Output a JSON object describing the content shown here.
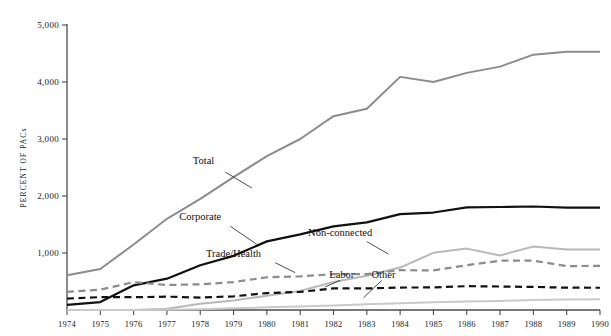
{
  "chart_data": {
    "type": "line",
    "title": "",
    "xlabel": "",
    "ylabel": "PERCENT OF PACs",
    "x": [
      1974,
      1975,
      1976,
      1977,
      1978,
      1979,
      1980,
      1981,
      1982,
      1983,
      1984,
      1985,
      1986,
      1987,
      1988,
      1989,
      1990
    ],
    "xtick_labels": [
      "1974",
      "1975",
      "1976",
      "1977",
      "1978",
      "1979",
      "1980",
      "1981",
      "1982",
      "1983",
      "1984",
      "1985",
      "1986",
      "1987",
      "1988",
      "1989",
      "1990"
    ],
    "ytick_labels": [
      "1,000",
      "2,000",
      "3,000",
      "4,000",
      "5,000"
    ],
    "yticks": [
      1000,
      2000,
      3000,
      4000,
      5000
    ],
    "ylim": [
      0,
      5000
    ],
    "xlim": [
      1974,
      1990
    ],
    "grid": false,
    "legend": "inline-annotations",
    "series": [
      {
        "name": "Total",
        "color": "#8c8c8c",
        "style": "solid",
        "width": 2.0,
        "label_x": 1978.1,
        "label_y": 2560,
        "leader": [
          [
            1978.75,
            2420
          ],
          [
            1979.55,
            2140
          ]
        ],
        "values": [
          608,
          720,
          1150,
          1600,
          1950,
          2330,
          2700,
          3000,
          3400,
          3530,
          4090,
          4000,
          4160,
          4270,
          4480,
          4530,
          4530
        ]
      },
      {
        "name": "Corporate",
        "color": "#111111",
        "style": "solid",
        "width": 2.2,
        "label_x": 1978.0,
        "label_y": 1580,
        "leader": [
          [
            1978.9,
            1470
          ],
          [
            1979.7,
            1150
          ]
        ],
        "values": [
          89,
          139,
          433,
          550,
          785,
          950,
          1204,
          1327,
          1467,
          1538,
          1682,
          1710,
          1800,
          1807,
          1816,
          1796,
          1795
        ]
      },
      {
        "name": "Non-connected",
        "color": "#b9b9b9",
        "style": "solid",
        "width": 2.0,
        "label_x": 1982.2,
        "label_y": 1300,
        "leader": [
          [
            1983.0,
            1200
          ],
          [
            1983.65,
            980
          ]
        ],
        "values": [
          0,
          0,
          0,
          20,
          110,
          165,
          250,
          335,
          490,
          600,
          745,
          1003,
          1077,
          957,
          1115,
          1060,
          1062
        ]
      },
      {
        "name": "Trade/Health",
        "color": "#8c8c8c",
        "style": "dashed",
        "width": 2.2,
        "label_x": 1979.0,
        "label_y": 930,
        "leader": [
          [
            1980.25,
            830
          ],
          [
            1980.85,
            655
          ]
        ],
        "values": [
          318,
          357,
          489,
          438,
          451,
          490,
          574,
          590,
          628,
          628,
          698,
          695,
          786,
          865,
          865,
          770,
          774
        ]
      },
      {
        "name": "Labor",
        "color": "#111111",
        "style": "dashed",
        "width": 2.2,
        "label_x": 1982.25,
        "label_y": 560,
        "leader": [
          [
            1982.2,
            520
          ],
          [
            1981.75,
            405
          ]
        ],
        "values": [
          201,
          226,
          224,
          234,
          217,
          240,
          297,
          318,
          380,
          378,
          394,
          396,
          418,
          412,
          405,
          392,
          390
        ]
      },
      {
        "name": "Other",
        "color": "#c9c9c9",
        "style": "solid",
        "width": 2.0,
        "label_x": 1983.5,
        "label_y": 560,
        "leader": [
          [
            1983.45,
            520
          ],
          [
            1982.9,
            215
          ]
        ],
        "values": [
          0,
          0,
          0,
          5,
          15,
          30,
          47,
          63,
          80,
          100,
          120,
          135,
          150,
          160,
          175,
          185,
          190
        ]
      }
    ]
  }
}
